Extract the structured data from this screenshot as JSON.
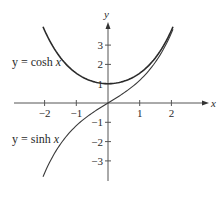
{
  "chart_data": {
    "type": "line",
    "title": "",
    "xlabel": "x",
    "ylabel": "y",
    "xlim": [
      -3,
      3.1
    ],
    "ylim": [
      -3.9,
      4.0
    ],
    "grid": false,
    "legend": "inline labels",
    "x_ticks": [
      "-2",
      "-1",
      "1",
      "2"
    ],
    "y_ticks": [
      "3",
      "2",
      "1",
      "-1",
      "-2",
      "-3"
    ],
    "series": [
      {
        "name": "y = cosh x",
        "function": "cosh",
        "x": [
          -2.05,
          -1.5,
          -1,
          -0.5,
          0,
          0.5,
          1,
          1.5,
          2.05
        ],
        "y": [
          3.95,
          2.35,
          1.54,
          1.13,
          1.0,
          1.13,
          1.54,
          2.35,
          3.95
        ]
      },
      {
        "name": "y = sinh x",
        "function": "sinh",
        "x": [
          -2.05,
          -1.5,
          -1,
          -0.5,
          0,
          0.5,
          1,
          1.5,
          2.05
        ],
        "y": [
          -3.82,
          -2.13,
          -1.18,
          -0.52,
          0,
          0.52,
          1.18,
          2.13,
          3.82
        ]
      }
    ],
    "annotations": [
      {
        "text_prefix": "y = cosh ",
        "text_var": "x"
      },
      {
        "text_prefix": "y = sinh ",
        "text_var": "x"
      }
    ]
  }
}
